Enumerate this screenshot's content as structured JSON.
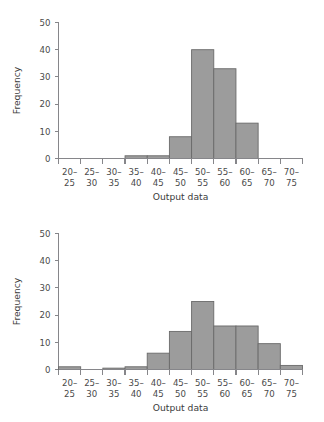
{
  "figure": {
    "background_color": "#ffffff",
    "bar_fill_color": "#9c9c9c",
    "bar_edge_color": "#6a6a6a",
    "axis_color": "#86868a",
    "text_color": "#3c3c3c"
  },
  "chart_data": [
    {
      "type": "bar",
      "id": "histogram-top",
      "title": "",
      "xlabel": "Output data",
      "ylabel": "Frequency",
      "categories": [
        "20-\n25",
        "25-\n30",
        "30-\n35",
        "35-\n40",
        "40-\n45",
        "45-\n50",
        "50-\n55",
        "55-\n60",
        "60-\n65",
        "65-\n70",
        "70-\n75"
      ],
      "category_lines": [
        [
          "20–",
          "25"
        ],
        [
          "25–",
          "30"
        ],
        [
          "30–",
          "35"
        ],
        [
          "35–",
          "40"
        ],
        [
          "40–",
          "45"
        ],
        [
          "45–",
          "50"
        ],
        [
          "50–",
          "55"
        ],
        [
          "55–",
          "60"
        ],
        [
          "60–",
          "65"
        ],
        [
          "65–",
          "70"
        ],
        [
          "70–",
          "75"
        ]
      ],
      "values": [
        0,
        0,
        0,
        1,
        1,
        8,
        40,
        33,
        13,
        0,
        0
      ],
      "ylim": [
        0,
        50
      ],
      "yticks": [
        0,
        10,
        20,
        30,
        40,
        50
      ],
      "ytick_labels": [
        "0",
        "10",
        "20",
        "30",
        "40",
        "50"
      ],
      "grid": false,
      "legend": "none"
    },
    {
      "type": "bar",
      "id": "histogram-bottom",
      "title": "",
      "xlabel": "Output data",
      "ylabel": "Frequency",
      "categories": [
        "20-\n25",
        "25-\n30",
        "30-\n35",
        "35-\n40",
        "40-\n45",
        "45-\n50",
        "50-\n55",
        "55-\n60",
        "60-\n65",
        "65-\n70",
        "70-\n75"
      ],
      "category_lines": [
        [
          "20–",
          "25"
        ],
        [
          "25–",
          "30"
        ],
        [
          "30–",
          "35"
        ],
        [
          "35–",
          "40"
        ],
        [
          "40–",
          "45"
        ],
        [
          "45–",
          "50"
        ],
        [
          "50–",
          "55"
        ],
        [
          "55–",
          "60"
        ],
        [
          "60–",
          "65"
        ],
        [
          "65–",
          "70"
        ],
        [
          "70–",
          "75"
        ]
      ],
      "values": [
        1,
        0,
        0.5,
        1,
        6,
        14,
        25,
        16,
        16,
        9.5,
        1.5
      ],
      "ylim": [
        0,
        50
      ],
      "yticks": [
        0,
        10,
        20,
        30,
        40,
        50
      ],
      "ytick_labels": [
        "0",
        "10",
        "20",
        "30",
        "40",
        "50"
      ],
      "grid": false,
      "legend": "none"
    }
  ]
}
